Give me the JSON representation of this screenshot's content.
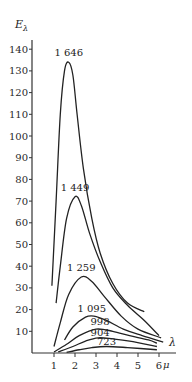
{
  "chart_data": {
    "type": "line",
    "title": "",
    "ylabel": "Eλ",
    "xlabel": "λ",
    "x_unit": "μ",
    "xlim": [
      0,
      6.5
    ],
    "ylim": [
      0,
      145
    ],
    "grid": false,
    "x_ticks": [
      "1",
      "2",
      "3",
      "4",
      "5",
      "6"
    ],
    "y_ticks": [
      "10",
      "20",
      "30",
      "40",
      "50",
      "60",
      "70",
      "80",
      "90",
      "100",
      "110",
      "120",
      "130",
      "140"
    ],
    "series": [
      {
        "name": "1 646",
        "label": "1 646",
        "peak": {
          "x": 1.7,
          "y": 134
        },
        "points": [
          [
            0.9,
            31
          ],
          [
            1.1,
            70
          ],
          [
            1.3,
            110
          ],
          [
            1.5,
            130
          ],
          [
            1.7,
            134
          ],
          [
            1.9,
            128
          ],
          [
            2.1,
            110
          ],
          [
            2.4,
            85
          ],
          [
            2.8,
            62
          ],
          [
            3.2,
            46
          ],
          [
            3.8,
            32
          ],
          [
            4.5,
            23
          ],
          [
            5.3,
            19
          ]
        ]
      },
      {
        "name": "1 449",
        "label": "1 449",
        "peak": {
          "x": 2.0,
          "y": 72
        },
        "points": [
          [
            1.1,
            23
          ],
          [
            1.3,
            40
          ],
          [
            1.6,
            62
          ],
          [
            2.0,
            72
          ],
          [
            2.3,
            68
          ],
          [
            2.7,
            55
          ],
          [
            3.2,
            42
          ],
          [
            3.8,
            30
          ],
          [
            4.5,
            22
          ],
          [
            5.3,
            15
          ],
          [
            6.0,
            8
          ]
        ]
      },
      {
        "name": "1 259",
        "label": "1 259",
        "peak": {
          "x": 2.3,
          "y": 35
        },
        "points": [
          [
            1.0,
            3
          ],
          [
            1.3,
            14
          ],
          [
            1.7,
            27
          ],
          [
            2.3,
            35
          ],
          [
            2.8,
            33
          ],
          [
            3.4,
            26
          ],
          [
            4.2,
            17
          ],
          [
            5.0,
            11
          ],
          [
            6.1,
            7
          ]
        ]
      },
      {
        "name": "1 095",
        "label": "1 095",
        "peak": {
          "x": 2.7,
          "y": 17
        },
        "points": [
          [
            1.5,
            6
          ],
          [
            1.9,
            12
          ],
          [
            2.5,
            16.5
          ],
          [
            2.9,
            17
          ],
          [
            3.5,
            15
          ],
          [
            4.3,
            11
          ],
          [
            5.2,
            8
          ],
          [
            6.2,
            5
          ]
        ]
      },
      {
        "name": "998",
        "label": "998",
        "peak": {
          "x": 3.0,
          "y": 11
        },
        "points": [
          [
            1.0,
            0.5
          ],
          [
            1.6,
            4
          ],
          [
            2.2,
            8
          ],
          [
            3.0,
            11
          ],
          [
            3.8,
            10
          ],
          [
            4.6,
            8
          ],
          [
            5.5,
            6
          ],
          [
            5.9,
            4.5
          ]
        ]
      },
      {
        "name": "904",
        "label": "904",
        "peak": {
          "x": 3.1,
          "y": 7
        },
        "points": [
          [
            1.2,
            0.5
          ],
          [
            1.9,
            3
          ],
          [
            2.5,
            5.5
          ],
          [
            3.1,
            7
          ],
          [
            3.8,
            6.5
          ],
          [
            4.6,
            5.5
          ],
          [
            5.9,
            3
          ]
        ]
      },
      {
        "name": "723",
        "label": "723",
        "peak": {
          "x": 3.5,
          "y": 3
        },
        "points": [
          [
            1.6,
            0.3
          ],
          [
            2.2,
            1.5
          ],
          [
            2.8,
            2.5
          ],
          [
            3.5,
            3
          ],
          [
            4.5,
            2.5
          ],
          [
            5.9,
            1.5
          ]
        ]
      }
    ]
  },
  "axes": {
    "y_title": "E",
    "y_title_sub": "λ",
    "x_title": "λ",
    "x_unit": "μ"
  }
}
